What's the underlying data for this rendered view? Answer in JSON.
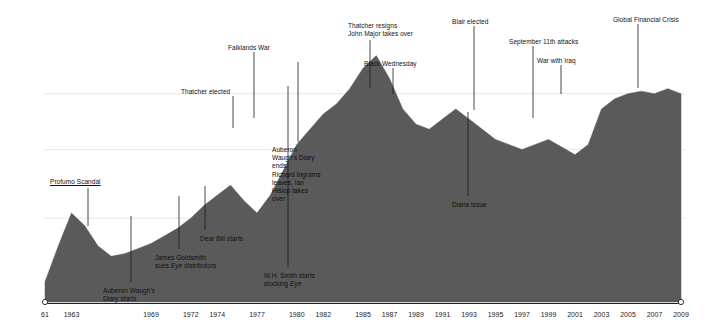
{
  "chart_data": {
    "type": "area",
    "title": "",
    "subtitle": "",
    "xlabel": "",
    "ylabel": "",
    "grid": true,
    "legend": false,
    "legend_position": "none",
    "fill_color": "#5a5a5a",
    "gridline_color": "#e6e6ec",
    "axis_color": "#222222",
    "annotation_line_color": "#1a1a1a",
    "xlim": [
      1961,
      2009
    ],
    "ylim": [
      0,
      100
    ],
    "x_tick_labels": [
      "61",
      "1963",
      "1969",
      "1972",
      "1974",
      "1977",
      "1980",
      "1982",
      "1985",
      "1987",
      "1989",
      "1991",
      "1993",
      "1995",
      "1997",
      "1999",
      "2001",
      "2003",
      "2005",
      "2007",
      "2009"
    ],
    "x_tick_values": [
      1961,
      1963,
      1969,
      1972,
      1974,
      1977,
      1980,
      1982,
      1985,
      1987,
      1989,
      1991,
      1993,
      1995,
      1997,
      1999,
      2001,
      2003,
      2005,
      2007,
      2009
    ],
    "gridline_values": [
      82,
      60,
      33
    ],
    "x": [
      1961,
      1962,
      1963,
      1964,
      1965,
      1966,
      1967,
      1968,
      1969,
      1970,
      1971,
      1972,
      1973,
      1974,
      1975,
      1976,
      1977,
      1978,
      1979,
      1980,
      1981,
      1982,
      1983,
      1984,
      1985,
      1986,
      1987,
      1988,
      1989,
      1990,
      1991,
      1992,
      1993,
      1994,
      1995,
      1996,
      1997,
      1998,
      1999,
      2000,
      2001,
      2002,
      2003,
      2004,
      2005,
      2006,
      2007,
      2008,
      2009
    ],
    "values": [
      8,
      22,
      35,
      30,
      22,
      18,
      19,
      21,
      23,
      26,
      29,
      33,
      38,
      42,
      46,
      40,
      35,
      42,
      52,
      62,
      68,
      74,
      78,
      84,
      92,
      97,
      88,
      76,
      70,
      68,
      72,
      76,
      72,
      68,
      64,
      62,
      60,
      62,
      64,
      61,
      58,
      62,
      76,
      80,
      82,
      83,
      82,
      84,
      82
    ],
    "series": [
      {
        "name": "Circulation",
        "values": [
          8,
          22,
          35,
          30,
          22,
          18,
          19,
          21,
          23,
          26,
          29,
          33,
          38,
          42,
          46,
          40,
          35,
          42,
          52,
          62,
          68,
          74,
          78,
          84,
          92,
          97,
          88,
          76,
          70,
          68,
          72,
          76,
          72,
          68,
          64,
          62,
          60,
          62,
          64,
          61,
          58,
          62,
          76,
          80,
          82,
          83,
          82,
          84,
          82
        ]
      }
    ],
    "end_markers": [
      "start-circle",
      "end-circle"
    ],
    "annotations": [
      {
        "id": "profumo",
        "label": "Profumo Scandal",
        "x_px": 50,
        "y_px": 178,
        "line_x": 88,
        "line_y1": 188,
        "line_y2": 226,
        "placement": "above",
        "underline": true
      },
      {
        "id": "auberon-start",
        "label": "Auberon Waugh's\nDiary starts",
        "x_px": 103,
        "y_px": 287,
        "line_x": 131,
        "line_y1": 216,
        "line_y2": 282,
        "placement": "below"
      },
      {
        "id": "goldsmith",
        "label": "James Goldsmith\nsues Eye distributors",
        "label_plain": "James Goldsmith sues Eye distributors",
        "x_px": 155,
        "y_px": 254,
        "line_x": 179,
        "line_y1": 196,
        "line_y2": 249,
        "placement": "below",
        "italic_word": "Eye"
      },
      {
        "id": "dear-bill",
        "label": "Dear Bill starts",
        "x_px": 200,
        "y_px": 235,
        "line_x": 205,
        "line_y1": 186,
        "line_y2": 230,
        "placement": "below"
      },
      {
        "id": "thatcher-elected",
        "label": "Thatcher elected",
        "x_px": 181,
        "y_px": 88,
        "line_x": 233,
        "line_y1": 96,
        "line_y2": 128,
        "placement": "above"
      },
      {
        "id": "falklands",
        "label": "Falklands War",
        "x_px": 228,
        "y_px": 44,
        "line_x": 254,
        "line_y1": 52,
        "line_y2": 118,
        "placement": "above"
      },
      {
        "id": "wh-smith",
        "label": "W.H. Smith starts\nstocking Eye",
        "label_plain": "W.H. Smith starts stocking Eye",
        "x_px": 264,
        "y_px": 272,
        "line_x": 288,
        "line_y1": 86,
        "line_y2": 267,
        "placement": "below",
        "italic_word": "Eye"
      },
      {
        "id": "auberon-end",
        "label": "Auberon\nWaugh's Diary\nends.\nRichard Ingrams\nleaves, Ian\nHislop takes\nover",
        "x_px": 272,
        "y_px": 146,
        "line_x": 298,
        "line_y1": 62,
        "line_y2": 142,
        "placement": "inside"
      },
      {
        "id": "thatcher-resigns",
        "label": "Thatcher resigns\nJohn Major takes over",
        "x_px": 348,
        "y_px": 22,
        "line_x": 370,
        "line_y1": 40,
        "line_y2": 88,
        "placement": "above"
      },
      {
        "id": "black-wednesday",
        "label": "Black Wednesday",
        "x_px": 364,
        "y_px": 60,
        "line_x": 393,
        "line_y1": 68,
        "line_y2": 94,
        "placement": "above"
      },
      {
        "id": "diana",
        "label": "Diana issue",
        "x_px": 452,
        "y_px": 201,
        "line_x": 468,
        "line_y1": 112,
        "line_y2": 196,
        "placement": "inside"
      },
      {
        "id": "blair",
        "label": "Blair elected",
        "x_px": 452,
        "y_px": 18,
        "line_x": 474,
        "line_y1": 26,
        "line_y2": 110,
        "placement": "above"
      },
      {
        "id": "sept11",
        "label": "September 11th attacks",
        "x_px": 509,
        "y_px": 38,
        "line_x": 533,
        "line_y1": 46,
        "line_y2": 118,
        "placement": "above"
      },
      {
        "id": "iraq",
        "label": "War with Iraq",
        "x_px": 537,
        "y_px": 57,
        "line_x": 561,
        "line_y1": 65,
        "line_y2": 94,
        "placement": "above"
      },
      {
        "id": "gfc",
        "label": "Global Financial Crisis",
        "x_px": 613,
        "y_px": 16,
        "line_x": 638,
        "line_y1": 24,
        "line_y2": 88,
        "placement": "above"
      }
    ]
  }
}
